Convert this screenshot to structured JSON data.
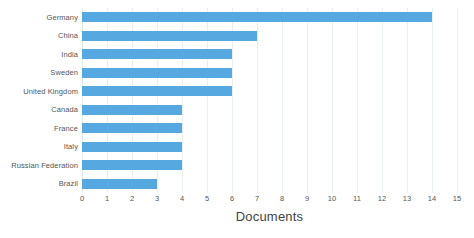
{
  "chart_data": {
    "type": "bar",
    "orientation": "horizontal",
    "title": "",
    "xlabel": "Documents",
    "ylabel": "",
    "categories": [
      "Germany",
      "China",
      "India",
      "Sweden",
      "United Kingdom",
      "Canada",
      "France",
      "Italy",
      "Russian Federation",
      "Brazil"
    ],
    "values": [
      14,
      7,
      6,
      6,
      6,
      4,
      4,
      4,
      4,
      3
    ],
    "xlim": [
      0,
      15
    ],
    "xticks": [
      0,
      1,
      2,
      3,
      4,
      5,
      6,
      7,
      8,
      9,
      10,
      11,
      12,
      13,
      14,
      15
    ],
    "xtick_labels": [
      "0",
      "1",
      "2",
      "3",
      "4",
      "5",
      "6",
      "7",
      "8",
      "9",
      "10",
      "11",
      "12",
      "13",
      "14",
      "15"
    ],
    "grid": "vertical",
    "legend": "none",
    "bar_color": "#56a8e0",
    "grid_color": "#e9eef2",
    "background": "#ffffff"
  }
}
